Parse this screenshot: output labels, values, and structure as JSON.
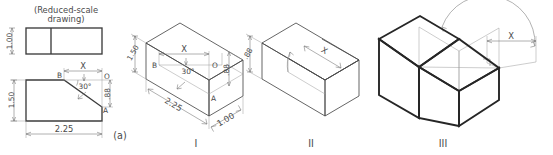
{
  "figure": {
    "caption_note_line1": "(Reduced-scale",
    "caption_note_line2": "drawing)",
    "part_label": "(a)"
  },
  "orthographic": {
    "top_view": {
      "depth_dim": "1.00"
    },
    "front_view": {
      "height_dim": "1.50",
      "width_dim": "2.25",
      "right_height_dim": ".88",
      "slope_dim": "X",
      "angle_dim": "30°",
      "vertex_b": "B",
      "vertex_o": "O",
      "vertex_a": "A"
    }
  },
  "steps": [
    {
      "numeral": "I",
      "dims": {
        "height": "1.50",
        "length": "2.25",
        "depth": "1.00",
        "right_height": ".88",
        "slope": "X",
        "angle": "30°"
      },
      "vertices": {
        "b": "B",
        "o": "O",
        "a": "A"
      }
    },
    {
      "numeral": "II",
      "dims": {
        "slope": "X",
        "right_height": ".88"
      }
    },
    {
      "numeral": "III",
      "dims": {
        "slope": "X"
      }
    }
  ],
  "colors": {
    "paper": "#ffffff",
    "object_line": "#3c3c3c",
    "bold_line": "#262626",
    "thin_line": "#6f6f6f",
    "text": "#4a4a4a"
  }
}
